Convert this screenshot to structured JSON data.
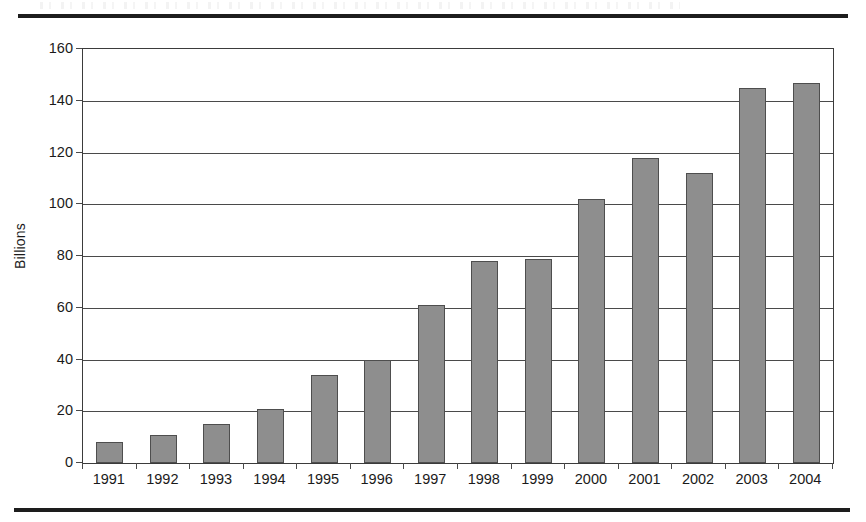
{
  "page": {
    "rule_top": "horizontal-rule",
    "rule_bottom": "horizontal-rule"
  },
  "chart_data": {
    "type": "bar",
    "title": "",
    "xlabel": "",
    "ylabel": "Billions",
    "categories": [
      "1991",
      "1992",
      "1993",
      "1994",
      "1995",
      "1996",
      "1997",
      "1998",
      "1999",
      "2000",
      "2001",
      "2002",
      "2003",
      "2004"
    ],
    "values": [
      8,
      11,
      15,
      21,
      34,
      40,
      61,
      78,
      79,
      102,
      118,
      112,
      145,
      147
    ],
    "ylim": [
      0,
      160
    ],
    "ytick_step": 20,
    "yticks": [
      "0",
      "20",
      "40",
      "60",
      "80",
      "100",
      "120",
      "140",
      "160"
    ],
    "grid": true,
    "legend": "none",
    "bar_color": "#8e8e8e",
    "bar_border_color": "#4e4e4e",
    "axis_color": "#3b3b3b",
    "grid_color": "#4a4a4a"
  }
}
